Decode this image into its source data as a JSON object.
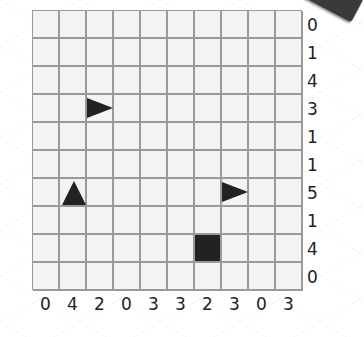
{
  "puzzle": {
    "rows": 10,
    "cols": 10,
    "row_clues": [
      "0",
      "1",
      "4",
      "3",
      "1",
      "1",
      "5",
      "1",
      "4",
      "0"
    ],
    "col_clues": [
      "0",
      "4",
      "2",
      "0",
      "3",
      "3",
      "2",
      "3",
      "0",
      "3"
    ],
    "pieces": [
      {
        "row": 3,
        "col": 2,
        "shape": "triangle-right-icon"
      },
      {
        "row": 6,
        "col": 1,
        "shape": "triangle-up-icon"
      },
      {
        "row": 6,
        "col": 7,
        "shape": "triangle-right-icon"
      },
      {
        "row": 8,
        "col": 6,
        "shape": "square-icon"
      }
    ],
    "colors": {
      "cell": "#f3f3f3",
      "grid_line": "#9a9a9a",
      "piece": "#222222"
    }
  }
}
